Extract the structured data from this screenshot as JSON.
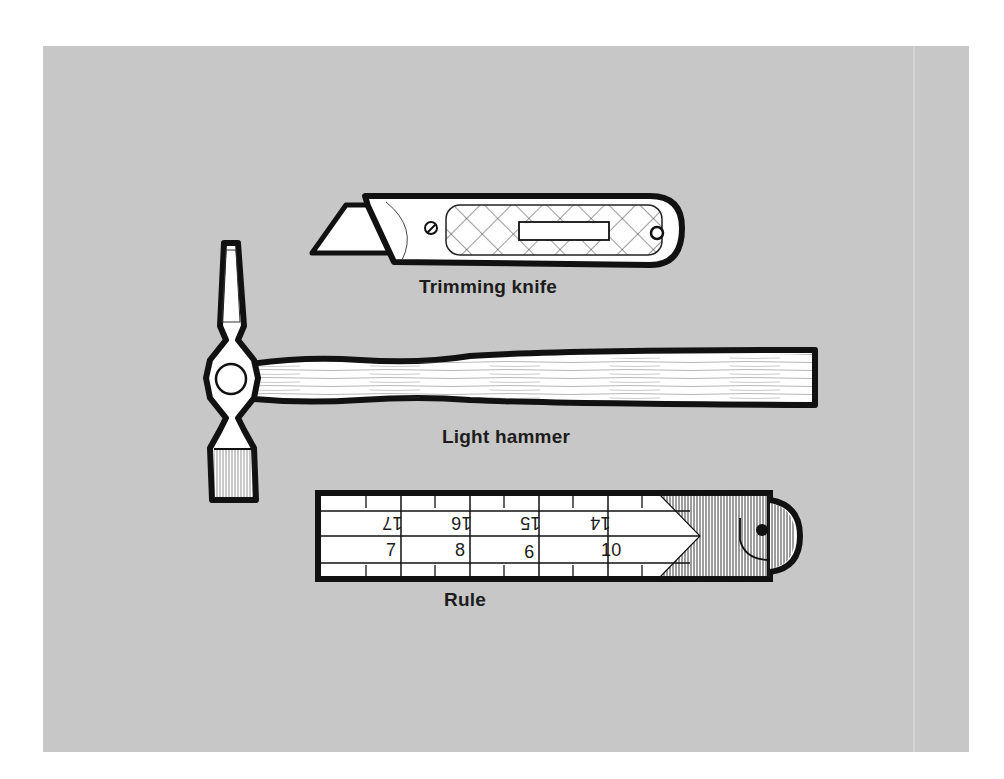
{
  "illustration": {
    "background_color": "#c7c7c7",
    "tools": [
      {
        "id": "trimming-knife",
        "label": "Trimming knife"
      },
      {
        "id": "light-hammer",
        "label": "Light hammer"
      },
      {
        "id": "rule",
        "label": "Rule",
        "scale_top": [
          "17",
          "16",
          "15",
          "14"
        ],
        "scale_bottom": [
          "7",
          "8",
          "9",
          "10"
        ]
      }
    ]
  }
}
